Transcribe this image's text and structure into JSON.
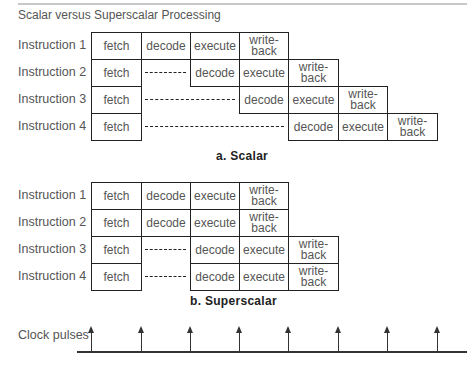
{
  "title": "Scalar versus Superscalar Processing",
  "stages": {
    "fetch": "fetch",
    "decode": "decode",
    "execute": "execute",
    "writeback": "write-\nback"
  },
  "scalar": {
    "caption": "a. Scalar",
    "rows": [
      {
        "label": "Instruction 1",
        "stages": [
          "fetch",
          "decode",
          "execute",
          "write-back"
        ],
        "start_col": 0,
        "stall_cols": 0
      },
      {
        "label": "Instruction 2",
        "stages": [
          "fetch",
          "decode",
          "execute",
          "write-back"
        ],
        "start_col": 0,
        "stall_cols": 1
      },
      {
        "label": "Instruction 3",
        "stages": [
          "fetch",
          "decode",
          "execute",
          "write-back"
        ],
        "start_col": 0,
        "stall_cols": 2
      },
      {
        "label": "Instruction 4",
        "stages": [
          "fetch",
          "decode",
          "execute",
          "write-back"
        ],
        "start_col": 0,
        "stall_cols": 3
      }
    ]
  },
  "superscalar": {
    "caption": "b. Superscalar",
    "rows": [
      {
        "label": "Instruction 1",
        "stages": [
          "fetch",
          "decode",
          "execute",
          "write-back"
        ],
        "stall_cols": 0
      },
      {
        "label": "Instruction 2",
        "stages": [
          "fetch",
          "decode",
          "execute",
          "write-back"
        ],
        "stall_cols": 0
      },
      {
        "label": "Instruction 3",
        "stages": [
          "fetch",
          "decode",
          "execute",
          "write-back"
        ],
        "stall_cols": 1
      },
      {
        "label": "Instruction 4",
        "stages": [
          "fetch",
          "decode",
          "execute",
          "write-back"
        ],
        "stall_cols": 1
      }
    ]
  },
  "clock": {
    "label": "Clock pulses",
    "pulse_count": 8
  },
  "labels": {
    "s1": "Instruction 1",
    "s2": "Instruction 2",
    "s3": "Instruction 3",
    "s4": "Instruction 4",
    "fetch": "fetch",
    "decode": "decode",
    "execute": "execute",
    "write": "write-",
    "back": "back"
  }
}
